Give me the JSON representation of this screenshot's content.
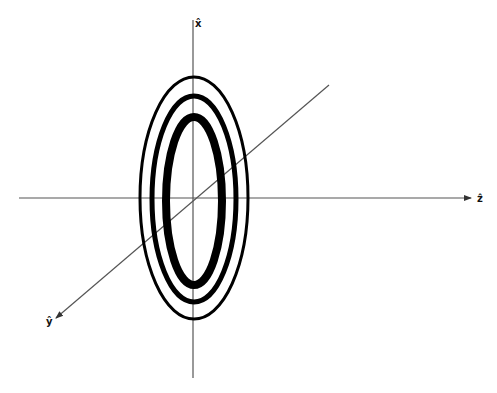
{
  "diagram": {
    "axes": [
      {
        "name": "x",
        "label": "x̂"
      },
      {
        "name": "y",
        "label": "ŷ"
      },
      {
        "name": "z",
        "label": "ẑ"
      }
    ],
    "ellipses": [
      {
        "name": "outer",
        "rx": 54,
        "ry": 121,
        "stroke_width": 3
      },
      {
        "name": "middle",
        "rx": 42,
        "ry": 103,
        "stroke_width": 5
      },
      {
        "name": "inner",
        "rx": 28,
        "ry": 84,
        "stroke_width": 8
      }
    ],
    "colors": {
      "axis": "#555555",
      "ellipse": "#000000",
      "background": "#ffffff"
    }
  }
}
